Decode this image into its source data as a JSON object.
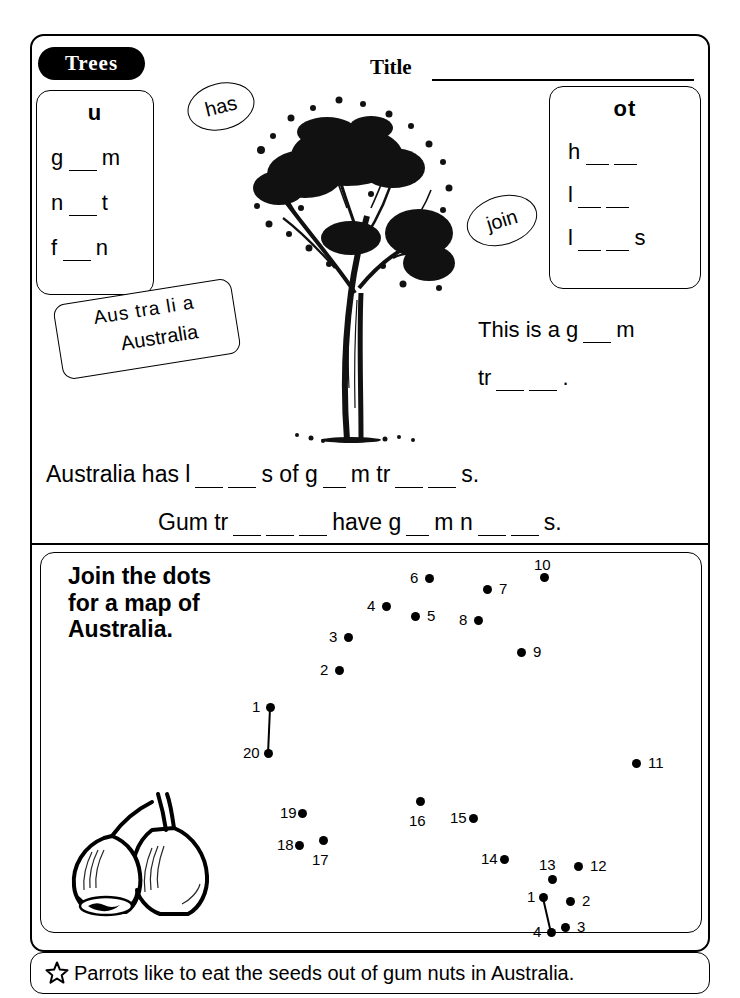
{
  "header": {
    "tab_label": "Trees",
    "title_label": "Title",
    "title_value": ""
  },
  "word_box_left": {
    "heading": "u",
    "words": [
      {
        "before": "g",
        "blanks": 1,
        "after": "m"
      },
      {
        "before": "n",
        "blanks": 1,
        "after": "t"
      },
      {
        "before": "f",
        "blanks": 1,
        "after": "n"
      }
    ],
    "word_texts": [
      "g __ m",
      "n __ t",
      "f __ n"
    ]
  },
  "word_box_right": {
    "heading": "ot",
    "words": [
      {
        "before": "h",
        "blanks": 2,
        "after": ""
      },
      {
        "before": "l",
        "blanks": 2,
        "after": ""
      },
      {
        "before": "l",
        "blanks": 2,
        "after": "s"
      }
    ],
    "word_texts": [
      "h __ __",
      "l __ __",
      "l __ __ s"
    ]
  },
  "bubbles": {
    "has": "has",
    "join": "join"
  },
  "australia_card": {
    "syllables": "Aus tra li a",
    "word": "Australia"
  },
  "sentences": {
    "right_line1_before": "This is a g",
    "right_line1_after": "m",
    "right_line2_before": "tr",
    "right_line2_after": ".",
    "main_a": {
      "p1": "Australia has l",
      "p2": "s of g",
      "p3": "m tr",
      "p4": "s."
    },
    "main_b": {
      "p1": "Gum tr",
      "p2": "have g",
      "p3": "m n",
      "p4": "s."
    }
  },
  "puzzle": {
    "title": "Join the dots for a map of Australia.",
    "title_lines": [
      "Join the dots",
      "for a map of",
      "Australia."
    ],
    "dots_main": [
      {
        "n": "1",
        "x": 270,
        "y": 707,
        "lx": 252,
        "ly": 698,
        "anchor": "left"
      },
      {
        "n": "2",
        "x": 339,
        "y": 670,
        "lx": 320,
        "ly": 661,
        "anchor": "left"
      },
      {
        "n": "3",
        "x": 348,
        "y": 637,
        "lx": 329,
        "ly": 628,
        "anchor": "left"
      },
      {
        "n": "4",
        "x": 386,
        "y": 606,
        "lx": 367,
        "ly": 597,
        "anchor": "left"
      },
      {
        "n": "5",
        "x": 415,
        "y": 616,
        "lx": 427,
        "ly": 607,
        "anchor": "right"
      },
      {
        "n": "6",
        "x": 429,
        "y": 578,
        "lx": 410,
        "ly": 569,
        "anchor": "left"
      },
      {
        "n": "7",
        "x": 487,
        "y": 589,
        "lx": 499,
        "ly": 580,
        "anchor": "right"
      },
      {
        "n": "8",
        "x": 478,
        "y": 620,
        "lx": 459,
        "ly": 611,
        "anchor": "left"
      },
      {
        "n": "9",
        "x": 521,
        "y": 652,
        "lx": 533,
        "ly": 643,
        "anchor": "right"
      },
      {
        "n": "10",
        "x": 544,
        "y": 577,
        "lx": 534,
        "ly": 556,
        "anchor": "above"
      },
      {
        "n": "11",
        "x": 636,
        "y": 763,
        "lx": 648,
        "ly": 754,
        "anchor": "right"
      },
      {
        "n": "12",
        "x": 578,
        "y": 866,
        "lx": 590,
        "ly": 857,
        "anchor": "right"
      },
      {
        "n": "13",
        "x": 552,
        "y": 879,
        "lx": 539,
        "ly": 856,
        "anchor": "above"
      },
      {
        "n": "14",
        "x": 504,
        "y": 859,
        "lx": 481,
        "ly": 850,
        "anchor": "left"
      },
      {
        "n": "15",
        "x": 473,
        "y": 818,
        "lx": 450,
        "ly": 809,
        "anchor": "left"
      },
      {
        "n": "16",
        "x": 420,
        "y": 801,
        "lx": 409,
        "ly": 812,
        "anchor": "below"
      },
      {
        "n": "17",
        "x": 323,
        "y": 840,
        "lx": 312,
        "ly": 851,
        "anchor": "below"
      },
      {
        "n": "18",
        "x": 299,
        "y": 845,
        "lx": 277,
        "ly": 836,
        "anchor": "left"
      },
      {
        "n": "19",
        "x": 302,
        "y": 813,
        "lx": 280,
        "ly": 804,
        "anchor": "left"
      },
      {
        "n": "20",
        "x": 268,
        "y": 753,
        "lx": 243,
        "ly": 744,
        "anchor": "left"
      }
    ],
    "dots_inset": [
      {
        "n": "1",
        "x": 543,
        "y": 897,
        "lx": 527,
        "ly": 888,
        "anchor": "left"
      },
      {
        "n": "2",
        "x": 570,
        "y": 901,
        "lx": 582,
        "ly": 892,
        "anchor": "right"
      },
      {
        "n": "3",
        "x": 565,
        "y": 927,
        "lx": 577,
        "ly": 918,
        "anchor": "right"
      },
      {
        "n": "4",
        "x": 551,
        "y": 932,
        "lx": 533,
        "ly": 923,
        "anchor": "left"
      }
    ],
    "join_lines": [
      {
        "x1": 270,
        "y1": 707,
        "x2": 268,
        "y2": 753
      },
      {
        "x1": 543,
        "y1": 897,
        "x2": 551,
        "y2": 932
      }
    ]
  },
  "footer": {
    "icon": "star-icon",
    "text": "Parrots like to eat the seeds out of gum nuts in Australia."
  },
  "illustrations": {
    "tree": "gum-tree-illustration",
    "gumnuts": "gum-nuts-illustration"
  },
  "colors": {
    "ink": "#000000",
    "paper": "#ffffff"
  }
}
